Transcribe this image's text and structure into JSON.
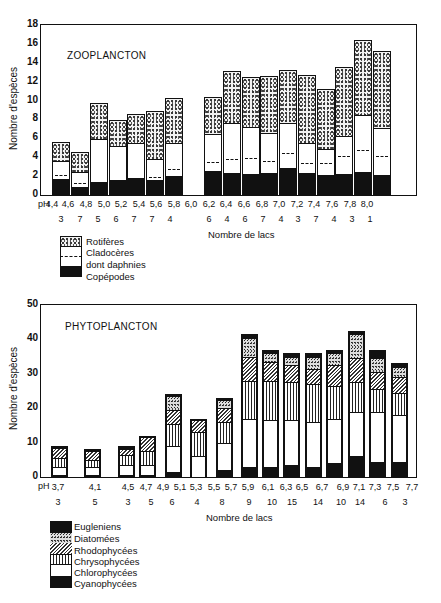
{
  "chart_data": [
    {
      "type": "bar",
      "stacked": true,
      "title": "ZOOPLANCTON",
      "ylabel": "Nombre d'espèces",
      "xlabel": "Nombre de lacs",
      "x_prefix": "pH",
      "ylim": [
        0,
        18
      ],
      "yticks": [
        0,
        2,
        4,
        6,
        8,
        10,
        12,
        14,
        16,
        18
      ],
      "grid": false,
      "categories": [
        "4,4",
        "4,6",
        "4,8",
        "5,0",
        "5,2",
        "5,4",
        "5,6",
        "5,8",
        "6,0",
        "6,2",
        "6,4",
        "6,6",
        "6,8",
        "7,0",
        "7,2",
        "7,4",
        "7,6",
        "7,8",
        "8,0"
      ],
      "lake_counts": [
        "3",
        "7",
        "5",
        "6",
        "7",
        "7",
        "4",
        "",
        "6",
        "4",
        "6",
        "7",
        "4",
        "3",
        "7",
        "4",
        "3",
        "1",
        ""
      ],
      "bars": [
        {
          "ph": "4,4",
          "copepodes": 1.7,
          "daphnies_line": 2.0,
          "cladoceres_top": 3.6,
          "total": 5.6
        },
        {
          "ph": "4,6",
          "copepodes": 0.9,
          "daphnies_line": 1.2,
          "cladoceres_top": 2.4,
          "total": 4.6
        },
        {
          "ph": "4,8",
          "copepodes": 1.4,
          "daphnies_line": null,
          "cladoceres_top": 5.9,
          "total": 9.7
        },
        {
          "ph": "5,0",
          "copepodes": 1.6,
          "daphnies_line": null,
          "cladoceres_top": 5.2,
          "total": 7.9
        },
        {
          "ph": "5,2",
          "copepodes": 1.8,
          "daphnies_line": null,
          "cladoceres_top": 5.5,
          "total": 8.6
        },
        {
          "ph": "5,4",
          "copepodes": 1.6,
          "daphnies_line": 1.8,
          "cladoceres_top": 3.8,
          "total": 8.9
        },
        {
          "ph": "5,6",
          "copepodes": 2.0,
          "daphnies_line": 2.6,
          "cladoceres_top": 5.5,
          "total": 10.3
        },
        {
          "ph": "6,0",
          "copepodes": 2.5,
          "daphnies_line": 3.4,
          "cladoceres_top": 6.5,
          "total": 10.4
        },
        {
          "ph": "6,2",
          "copepodes": 2.3,
          "daphnies_line": 3.7,
          "cladoceres_top": 7.6,
          "total": 13.1
        },
        {
          "ph": "6,4",
          "copepodes": 2.2,
          "daphnies_line": 3.8,
          "cladoceres_top": 7.2,
          "total": 12.5
        },
        {
          "ph": "6,6",
          "copepodes": 2.3,
          "daphnies_line": 3.5,
          "cladoceres_top": 6.6,
          "total": 12.6
        },
        {
          "ph": "6,8",
          "copepodes": 2.9,
          "daphnies_line": 4.3,
          "cladoceres_top": 7.6,
          "total": 13.2
        },
        {
          "ph": "7,0",
          "copepodes": 2.3,
          "daphnies_line": 3.3,
          "cladoceres_top": 5.5,
          "total": 12.7
        },
        {
          "ph": "7,2",
          "copepodes": 2.1,
          "daphnies_line": 3.3,
          "cladoceres_top": 4.9,
          "total": 11.2
        },
        {
          "ph": "7,4",
          "copepodes": 2.2,
          "daphnies_line": 4.0,
          "cladoceres_top": 6.2,
          "total": 13.6
        },
        {
          "ph": "7,6",
          "copepodes": 2.4,
          "daphnies_line": 4.7,
          "cladoceres_top": 8.5,
          "total": 16.4
        },
        {
          "ph": "7,8",
          "copepodes": 2.1,
          "daphnies_line": 4.0,
          "cladoceres_top": 7.1,
          "total": 15.2
        }
      ],
      "series": [
        {
          "name": "Rotifères",
          "pattern": "stipple"
        },
        {
          "name": "Cladocères",
          "pattern": "white"
        },
        {
          "name": "dont daphnies",
          "pattern": "dashed-line"
        },
        {
          "name": "Copépodes",
          "pattern": "black"
        }
      ]
    },
    {
      "type": "bar",
      "stacked": true,
      "title": "PHYTOPLANCTON",
      "ylabel": "Nombre d'espèces",
      "xlabel": "Nombre de lacs",
      "x_prefix": "pH",
      "ylim": [
        0,
        50
      ],
      "yticks": [
        0,
        10,
        20,
        30,
        40,
        50
      ],
      "grid": false,
      "categories": [
        "3,7",
        "4,1",
        "4,5",
        "4,7",
        "4,9",
        "5,1",
        "5,3",
        "5,5",
        "5,7",
        "5,9",
        "6,1",
        "6,3",
        "6,5",
        "6,7",
        "6,9",
        "7,1",
        "7,3",
        "7,5",
        "7,7"
      ],
      "lake_counts": [
        "3",
        "5",
        "3",
        "5",
        "6",
        "4",
        "8",
        "9",
        "10",
        "15",
        "14",
        "10",
        "14",
        "6",
        "3"
      ],
      "series": [
        {
          "name": "Eugleniens",
          "pattern": "black"
        },
        {
          "name": "Diatomées",
          "pattern": "dense-stipple"
        },
        {
          "name": "Rhodophycées",
          "pattern": "diagonal-hatch"
        },
        {
          "name": "Chrysophycées",
          "pattern": "vertical-lines"
        },
        {
          "name": "Chlorophycées",
          "pattern": "white"
        },
        {
          "name": "Cyanophycées",
          "pattern": "black"
        }
      ],
      "bars": [
        {
          "ph": "3,7",
          "cyanophycees": 0.5,
          "chlorophycees": 2.5,
          "chrysophycees": 2.5,
          "rhodophycees": 3.0,
          "diatomees": 0.0,
          "eugleniens": 1.0,
          "total": 9.0
        },
        {
          "ph": "4,1",
          "cyanophycees": 0.5,
          "chlorophycees": 2.5,
          "chrysophycees": 2.0,
          "rhodophycees": 2.5,
          "diatomees": 0.0,
          "eugleniens": 0.5,
          "total": 8.0
        },
        {
          "ph": "4,5",
          "cyanophycees": 0.5,
          "chlorophycees": 3.0,
          "chrysophycees": 3.0,
          "rhodophycees": 1.5,
          "diatomees": 0.0,
          "eugleniens": 1.0,
          "total": 9.0
        },
        {
          "ph": "4,7",
          "cyanophycees": 0.5,
          "chlorophycees": 3.0,
          "chrysophycees": 4.0,
          "rhodophycees": 4.0,
          "diatomees": 0.0,
          "eugleniens": 0.5,
          "total": 12.0
        },
        {
          "ph": "4,9-5,1",
          "cyanophycees": 1.5,
          "chlorophycees": 7.5,
          "chrysophycees": 6.5,
          "rhodophycees": 4.0,
          "diatomees": 4.0,
          "eugleniens": 0.5,
          "total": 24.0
        },
        {
          "ph": "5,3",
          "cyanophycees": 0.0,
          "chlorophycees": 6.0,
          "chrysophycees": 7.0,
          "rhodophycees": 3.5,
          "diatomees": 0.0,
          "eugleniens": 0.5,
          "total": 17.0
        },
        {
          "ph": "5,5-5,7",
          "cyanophycees": 2.0,
          "chlorophycees": 8.0,
          "chrysophycees": 6.0,
          "rhodophycees": 4.0,
          "diatomees": 2.5,
          "eugleniens": 0.5,
          "total": 23.0
        },
        {
          "ph": "5,9",
          "cyanophycees": 3.0,
          "chlorophycees": 14.0,
          "chrysophycees": 11.0,
          "rhodophycees": 7.0,
          "diatomees": 5.5,
          "eugleniens": 1.0,
          "total": 41.5
        },
        {
          "ph": "6,1",
          "cyanophycees": 3.0,
          "chlorophycees": 13.5,
          "chrysophycees": 11.5,
          "rhodophycees": 5.5,
          "diatomees": 2.5,
          "eugleniens": 1.0,
          "total": 37.0
        },
        {
          "ph": "6,3-6,5",
          "cyanophycees": 3.5,
          "chlorophycees": 13.0,
          "chrysophycees": 11.0,
          "rhodophycees": 5.0,
          "diatomees": 2.5,
          "eugleniens": 1.0,
          "total": 36.0
        },
        {
          "ph": "6,7",
          "cyanophycees": 3.0,
          "chlorophycees": 13.0,
          "chrysophycees": 11.0,
          "rhodophycees": 4.5,
          "diatomees": 3.5,
          "eugleniens": 1.0,
          "total": 36.0
        },
        {
          "ph": "6,9",
          "cyanophycees": 4.0,
          "chlorophycees": 13.0,
          "chrysophycees": 9.5,
          "rhodophycees": 6.0,
          "diatomees": 3.5,
          "eugleniens": 1.0,
          "total": 37.0
        },
        {
          "ph": "7,1-7,3",
          "cyanophycees": 6.0,
          "chlorophycees": 13.0,
          "chrysophycees": 8.5,
          "rhodophycees": 7.0,
          "diatomees": 7.0,
          "eugleniens": 1.0,
          "total": 42.5
        },
        {
          "ph": "7,5",
          "cyanophycees": 4.5,
          "chlorophycees": 14.5,
          "chrysophycees": 6.5,
          "rhodophycees": 5.0,
          "diatomees": 4.0,
          "eugleniens": 2.5,
          "total": 37.0
        },
        {
          "ph": "7,7",
          "cyanophycees": 4.5,
          "chlorophycees": 13.5,
          "chrysophycees": 6.5,
          "rhodophycees": 4.5,
          "diatomees": 3.0,
          "eugleniens": 1.0,
          "total": 33.0
        }
      ]
    }
  ],
  "zoo": {
    "title": "ZOOPLANCTON",
    "ylabel": "Nombre d'espèces",
    "xlabel": "Nombre de lacs",
    "ph_prefix": "pH",
    "ph_labels": [
      "4,4",
      "4,6",
      "4,8",
      "5,0",
      "5,2",
      "5,4",
      "5,6",
      "5,8",
      "6,0",
      "6,2",
      "6,4",
      "6,6",
      "6,8",
      "7,0",
      "7,2",
      "7,4",
      "7,6",
      "7,8",
      "8,0"
    ],
    "lake_counts": [
      "3",
      "7",
      "5",
      "6",
      "7",
      "7",
      "4",
      "6",
      "4",
      "6",
      "7",
      "4",
      "3",
      "7",
      "4",
      "3",
      "1"
    ],
    "yticks": [
      "0",
      "2",
      "4",
      "6",
      "8",
      "10",
      "12",
      "14",
      "16",
      "18"
    ],
    "legend": {
      "rotiferes": "Rotifères",
      "cladoceres": "Cladocères",
      "daphnies": "dont daphnies",
      "copepodes": "Copépodes"
    }
  },
  "phyto": {
    "title": "PHYTOPLANCTON",
    "ylabel": "Nombre d'espèces",
    "xlabel": "Nombre de lacs",
    "ph_prefix": "pH",
    "ph_labels": [
      "3,7",
      "4,1",
      "4,5",
      "4,7",
      "4,9",
      "5,1",
      "5,3",
      "5,5",
      "5,7",
      "5,9",
      "6,1",
      "6,3",
      "6,5",
      "6,7",
      "6,9",
      "7,1",
      "7,3",
      "7,5",
      "7,7"
    ],
    "lake_counts": [
      "3",
      "5",
      "3",
      "5",
      "6",
      "4",
      "8",
      "9",
      "10",
      "15",
      "14",
      "10",
      "14",
      "6",
      "3"
    ],
    "yticks": [
      "0",
      "10",
      "20",
      "30",
      "40",
      "50"
    ],
    "legend": {
      "eugleniens": "Eugleniens",
      "diatomees": "Diatomées",
      "rhodophycees": "Rhodophycées",
      "chrysophycees": "Chrysophycées",
      "chlorophycees": "Chlorophycées",
      "cyanophycees": "Cyanophycées"
    }
  }
}
